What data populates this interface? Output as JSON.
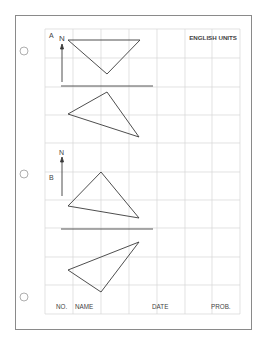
{
  "header": {
    "units_label": "ENGLISH UNITS"
  },
  "problems": [
    {
      "label": "A",
      "north_label": "N"
    },
    {
      "label": "B",
      "north_label": "N"
    }
  ],
  "footer": {
    "no_label": "NO.",
    "name_label": "NAME",
    "date_label": "DATE",
    "prob_label": "PROB."
  },
  "colors": {
    "grid": "#d6d6d6",
    "ink": "#3a3a3a",
    "border": "#8a8a8a"
  }
}
